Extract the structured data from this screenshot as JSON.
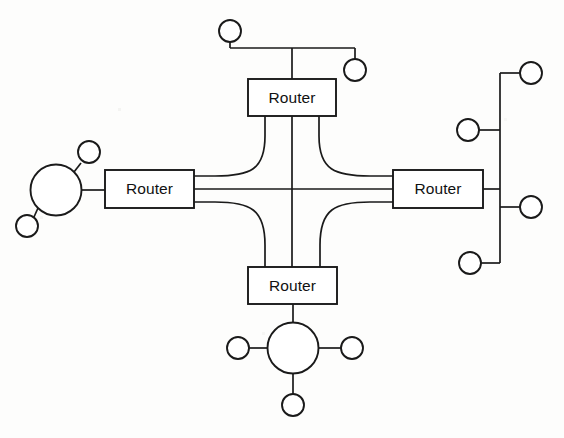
{
  "diagram": {
    "type": "network-topology",
    "background_color": "#fdfdfc",
    "line_color": "#1a1a1a",
    "canvas": {
      "width": 564,
      "height": 438
    },
    "routers": [
      {
        "id": "router-top",
        "label": "Router",
        "x": 248,
        "y": 79,
        "width": 88,
        "height": 37,
        "cx": 292,
        "cy": 97.5
      },
      {
        "id": "router-left",
        "label": "Router",
        "x": 105,
        "y": 170,
        "width": 89,
        "height": 38,
        "cx": 149.5,
        "cy": 189
      },
      {
        "id": "router-right",
        "label": "Router",
        "x": 393,
        "y": 170,
        "width": 90,
        "height": 38,
        "cx": 438,
        "cy": 189
      },
      {
        "id": "router-bottom",
        "label": "Router",
        "x": 248,
        "y": 267,
        "width": 89,
        "height": 37,
        "cx": 292.5,
        "cy": 285.5
      }
    ],
    "clouds": [
      {
        "id": "cloud-left",
        "cx": 56,
        "cy": 190,
        "r": 25.5
      },
      {
        "id": "cloud-bottom",
        "cx": 293,
        "cy": 348,
        "r": 25.5
      }
    ],
    "hosts": [
      {
        "id": "host-top-bus-left",
        "cx": 230,
        "cy": 31,
        "r": 11
      },
      {
        "id": "host-top-bus-right",
        "cx": 355,
        "cy": 70,
        "r": 11
      },
      {
        "id": "host-left-cloud-up",
        "cx": 89,
        "cy": 152,
        "r": 11
      },
      {
        "id": "host-left-cloud-down",
        "cx": 27,
        "cy": 226,
        "r": 11
      },
      {
        "id": "host-right-bus-top",
        "cx": 531,
        "cy": 73,
        "r": 11
      },
      {
        "id": "host-right-bus-mid-left",
        "cx": 468,
        "cy": 130,
        "r": 11
      },
      {
        "id": "host-right-bus-mid-right",
        "cx": 531,
        "cy": 207,
        "r": 11
      },
      {
        "id": "host-right-bus-bottom",
        "cx": 470,
        "cy": 263,
        "r": 11
      },
      {
        "id": "host-bottom-cloud-left",
        "cx": 238,
        "cy": 348,
        "r": 11
      },
      {
        "id": "host-bottom-cloud-right",
        "cx": 352,
        "cy": 348,
        "r": 11
      },
      {
        "id": "host-bottom-cloud-down",
        "cx": 293,
        "cy": 405,
        "r": 11
      }
    ],
    "mesh_links": [
      {
        "id": "link-top-left",
        "from": "router-top",
        "to": "router-left",
        "style": "curved"
      },
      {
        "id": "link-top-bottom",
        "from": "router-top",
        "to": "router-bottom",
        "style": "straight-vertical"
      },
      {
        "id": "link-top-right",
        "from": "router-top",
        "to": "router-right",
        "style": "curved"
      },
      {
        "id": "link-left-right",
        "from": "router-left",
        "to": "router-right",
        "style": "straight-horizontal"
      },
      {
        "id": "link-left-bottom",
        "from": "router-left",
        "to": "router-bottom",
        "style": "curved"
      },
      {
        "id": "link-right-bottom",
        "from": "router-right",
        "to": "router-bottom",
        "style": "curved"
      }
    ],
    "segments": {
      "top_bus": {
        "y": 48,
        "x_left": 230,
        "x_right": 355,
        "drop_x": 292
      },
      "right_bus": {
        "x": 500,
        "y_top": 73,
        "y_bottom": 263,
        "router_tap_y": 189
      }
    }
  }
}
